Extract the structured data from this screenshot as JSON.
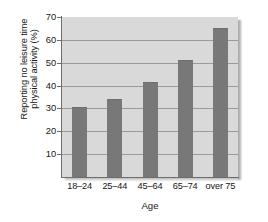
{
  "chart_data": {
    "type": "bar",
    "title": "",
    "categories": [
      "18–24",
      "25–44",
      "45–64",
      "65–74",
      "over 75"
    ],
    "values": [
      30.5,
      34,
      41.5,
      51,
      65
    ],
    "xlabel": "Age",
    "ylabel_line1": "Reporting no leisure time",
    "ylabel_line2": "physical activity (%)",
    "ylabel": "Reporting no leisure time physical activity (%)",
    "ylim": [
      0,
      70
    ],
    "ytick_labels": [
      "70",
      "60",
      "50",
      "40",
      "30",
      "20",
      "10"
    ],
    "ytick_values": [
      70,
      60,
      50,
      40,
      30,
      20,
      10
    ],
    "grid": true,
    "legend": "none",
    "colors": {
      "bar": "#787878",
      "plot_background": "#d9d9d9",
      "gridline": "#9a9a9a",
      "axis": "#6d6d6d",
      "text": "#161616",
      "page_background": "#ffffff"
    }
  }
}
